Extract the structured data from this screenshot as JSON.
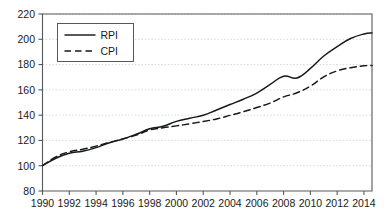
{
  "chart_data": {
    "type": "line",
    "title": "",
    "xlabel": "",
    "ylabel": "",
    "xlim": [
      1990,
      2014.6
    ],
    "ylim": [
      80,
      220
    ],
    "ytick_values": [
      80,
      100,
      120,
      140,
      160,
      180,
      200,
      220
    ],
    "ytick_labels": [
      "80",
      "100",
      "120",
      "140",
      "160",
      "180",
      "200",
      "220"
    ],
    "xtick_values": [
      1990,
      1992,
      1994,
      1996,
      1998,
      2000,
      2002,
      2004,
      2006,
      2008,
      2010,
      2012,
      2014
    ],
    "xtick_labels": [
      "1990",
      "1992",
      "1994",
      "1996",
      "1998",
      "2000",
      "2002",
      "2004",
      "2006",
      "2008",
      "2010",
      "2012",
      "2014"
    ],
    "grid": true,
    "grid_axis": "y",
    "legend_position": "upper-left",
    "x": [
      1990,
      1991,
      1992,
      1993,
      1994,
      1995,
      1996,
      1997,
      1998,
      1999,
      2000,
      2001,
      2002,
      2003,
      2004,
      2005,
      2006,
      2007,
      2008,
      2009,
      2010,
      2011,
      2012,
      2013,
      2014,
      2014.6
    ],
    "series": [
      {
        "name": "RPI",
        "style": "solid",
        "color": "#16181a",
        "values": [
          100.0,
          105.9,
          109.8,
          111.5,
          114.3,
          118.2,
          121.1,
          124.9,
          129.2,
          131.2,
          135.1,
          137.6,
          139.9,
          144.1,
          148.4,
          152.6,
          157.5,
          164.3,
          170.8,
          169.4,
          177.0,
          186.8,
          194.2,
          200.6,
          204.2,
          205.0
        ],
        "start_value": 100.0,
        "end_value": 205.0
      },
      {
        "name": "CPI",
        "style": "dashed",
        "color": "#16181a",
        "values": [
          100.0,
          107.0,
          111.0,
          113.0,
          115.5,
          118.5,
          121.2,
          124.2,
          128.2,
          130.0,
          131.5,
          133.2,
          135.0,
          137.0,
          139.8,
          142.7,
          146.0,
          149.6,
          154.4,
          157.7,
          162.9,
          170.3,
          175.0,
          177.5,
          179.0,
          179.2
        ],
        "start_value": 100.0,
        "end_value": 179.2
      }
    ]
  },
  "legend": {
    "entries": [
      {
        "label": "RPI",
        "style": "solid"
      },
      {
        "label": "CPI",
        "style": "dashed"
      }
    ]
  }
}
